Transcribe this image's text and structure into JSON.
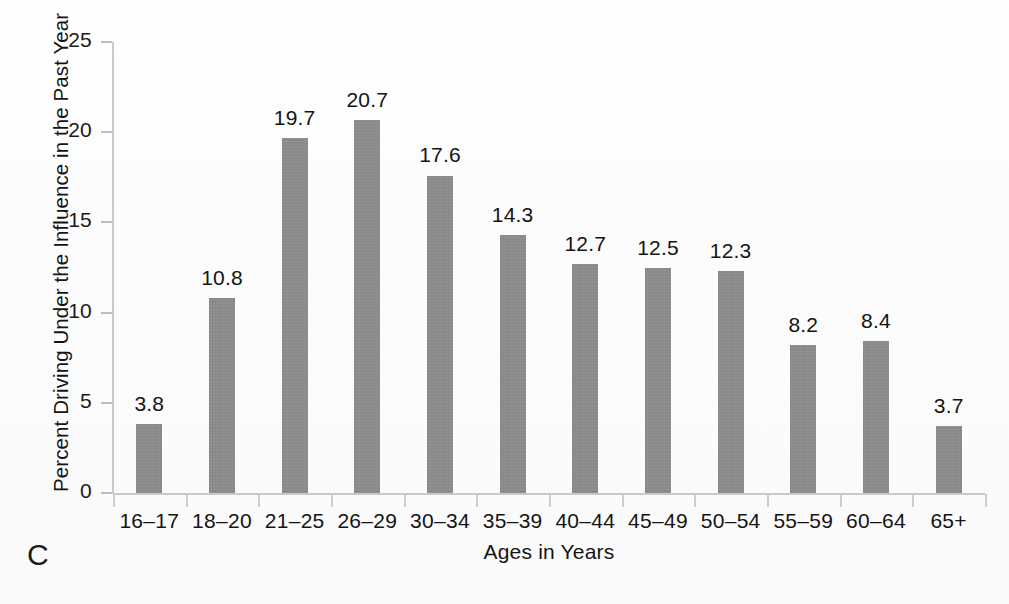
{
  "figure": {
    "panel_label": "C",
    "background_color": "#fdfdfd",
    "bar_color": "#8c8c8c",
    "axis_color": "#c9c9c9",
    "text_color": "#141414"
  },
  "chart_data": {
    "type": "bar",
    "title": "",
    "subtitle": "",
    "xlabel": "Ages in Years",
    "ylabel": "Percent Driving Under the Influence in the Past Year",
    "categories": [
      "16–17",
      "18–20",
      "21–25",
      "26–29",
      "30–34",
      "35–39",
      "40–44",
      "45–49",
      "50–54",
      "55–59",
      "60–64",
      "65+"
    ],
    "values": [
      3.8,
      10.8,
      19.7,
      20.7,
      17.6,
      14.3,
      12.7,
      12.5,
      12.3,
      8.2,
      8.4,
      3.7
    ],
    "value_labels": [
      "3.8",
      "10.8",
      "19.7",
      "20.7",
      "17.6",
      "14.3",
      "12.7",
      "12.5",
      "12.3",
      "8.2",
      "8.4",
      "3.7"
    ],
    "ylim": [
      0,
      25
    ],
    "yticks": [
      0,
      5,
      10,
      15,
      20,
      25
    ],
    "ytick_labels": [
      "0",
      "5",
      "10",
      "15",
      "20",
      "25"
    ],
    "grid": false,
    "legend": null,
    "legend_position": "none",
    "annotations": [
      "C"
    ]
  }
}
